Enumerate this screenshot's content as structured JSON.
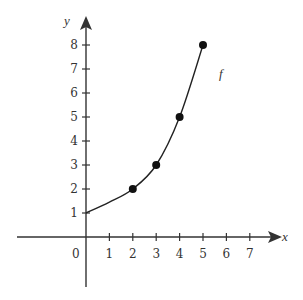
{
  "chart_data": {
    "type": "line",
    "title": "",
    "xlabel": "x",
    "ylabel": "y",
    "xlim": [
      -3,
      8
    ],
    "ylim": [
      -2,
      9
    ],
    "grid": false,
    "origin_label": "0",
    "x_ticks": [
      1,
      2,
      3,
      4,
      5,
      6,
      7
    ],
    "y_ticks": [
      1,
      2,
      3,
      4,
      5,
      6,
      7,
      8
    ],
    "series": [
      {
        "name": "f",
        "curve": [
          [
            0,
            1
          ],
          [
            1,
            1.45
          ],
          [
            2,
            2
          ],
          [
            3,
            3
          ],
          [
            4,
            5
          ],
          [
            5,
            8
          ]
        ],
        "marked_points": [
          [
            2,
            2
          ],
          [
            3,
            3
          ],
          [
            4,
            5
          ],
          [
            5,
            8
          ]
        ],
        "color": "#222222"
      }
    ],
    "annotations": [
      {
        "text": "f",
        "x": 5.8,
        "y": 6.9
      }
    ]
  },
  "colors": {
    "axis": "#333333",
    "curve": "#222222",
    "point": "#111111",
    "background": "#ffffff"
  }
}
